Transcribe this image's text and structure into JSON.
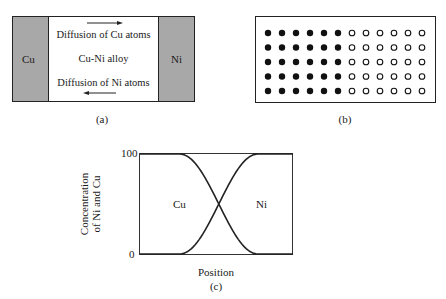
{
  "panel_a": {
    "left_metal": "Cu",
    "right_metal": "Ni",
    "top_label": "Diffusion of Cu atoms",
    "middle_label": "Cu-Ni alloy",
    "bottom_label": "Diffusion of Ni atoms",
    "top_arrow_direction": "right",
    "bottom_arrow_direction": "left",
    "caption": "(a)"
  },
  "panel_b": {
    "rows": 5,
    "columns": 12,
    "filled_columns": 6,
    "hollow_columns": 6,
    "caption": "(b)"
  },
  "panel_c": {
    "ylabel_line1": "Concentration",
    "ylabel_line2": "of Ni and Cu",
    "y_tick_top": "100",
    "y_tick_bottom": "0",
    "xlabel": "Position",
    "left_curve_label": "Cu",
    "right_curve_label": "Ni",
    "caption": "(c)"
  },
  "chart_data": {
    "type": "line",
    "title": "",
    "xlabel": "Position",
    "ylabel": "Concentration of Ni and Cu",
    "ylim": [
      0,
      100
    ],
    "y_ticks": [
      "0",
      "100"
    ],
    "x": [
      0,
      0.25,
      0.35,
      0.45,
      0.5,
      0.55,
      0.65,
      0.75,
      1
    ],
    "series": [
      {
        "name": "Cu",
        "values": [
          100,
          100,
          85,
          62,
          50,
          38,
          15,
          0,
          0
        ]
      },
      {
        "name": "Ni",
        "values": [
          0,
          0,
          15,
          38,
          50,
          62,
          85,
          100,
          100
        ]
      }
    ],
    "grid": false,
    "legend": "inline labels"
  }
}
